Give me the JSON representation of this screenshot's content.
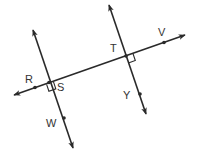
{
  "diagram": {
    "title": "",
    "stroke_color": "#2a2a2a",
    "label_color": "#333333",
    "lines": [
      {
        "id": "line-rv",
        "description": "transversal through R, S, T, V",
        "from": [
          14,
          95
        ],
        "to": [
          185,
          35
        ]
      },
      {
        "id": "line-sw",
        "description": "line through S and W, perpendicular to RV",
        "from": [
          33,
          30
        ],
        "to": [
          73,
          148
        ]
      },
      {
        "id": "line-ty",
        "description": "line through T and Y, perpendicular to RV",
        "from": [
          109,
          5
        ],
        "to": [
          146,
          114
        ]
      }
    ],
    "points": [
      {
        "name": "R",
        "x": 35,
        "y": 87.5
      },
      {
        "name": "S",
        "x": 49,
        "y": 82.5
      },
      {
        "name": "T",
        "x": 126,
        "y": 56
      },
      {
        "name": "V",
        "x": 164,
        "y": 42.5
      },
      {
        "name": "Y",
        "x": 140,
        "y": 94
      },
      {
        "name": "W",
        "x": 64,
        "y": 118
      }
    ],
    "labels": [
      {
        "text": "R",
        "x": 25,
        "y": 83
      },
      {
        "text": "S",
        "x": 57,
        "y": 91
      },
      {
        "text": "T",
        "x": 110,
        "y": 52
      },
      {
        "text": "V",
        "x": 158,
        "y": 36
      },
      {
        "text": "Y",
        "x": 123,
        "y": 99
      },
      {
        "text": "W",
        "x": 46,
        "y": 127
      }
    ],
    "right_angles": [
      {
        "at": "S",
        "description": "right angle mark between ray S-toward-V? below line at S"
      },
      {
        "at": "T",
        "description": "right angle mark below-right at T"
      }
    ]
  }
}
